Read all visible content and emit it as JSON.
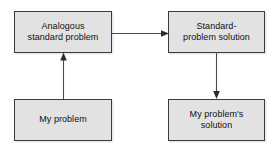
{
  "diagram": {
    "type": "flowchart",
    "background_color": "#ffffff",
    "box_fill_color": "#e2e2e2",
    "box_border_color": "#3a3a3a",
    "arrow_color": "#4a4a4a",
    "text_color": "#111111",
    "nodes": [
      {
        "id": "analogous-standard-problem",
        "label": "Analogous\nstandard problem",
        "position": "top-left"
      },
      {
        "id": "standard-problem-solution",
        "label": "Standard-\nproblem solution",
        "position": "top-right"
      },
      {
        "id": "my-problem",
        "label": "My problem",
        "position": "bottom-left"
      },
      {
        "id": "my-problems-solution",
        "label": "My problem's\nsolution",
        "position": "bottom-right"
      }
    ],
    "arrows": [
      {
        "id": "my-problem-to-analogous",
        "from": "my-problem",
        "to": "analogous-standard-problem",
        "direction": "up"
      },
      {
        "id": "analogous-to-standard-solution",
        "from": "analogous-standard-problem",
        "to": "standard-problem-solution",
        "direction": "right"
      },
      {
        "id": "standard-solution-to-my-solution",
        "from": "standard-problem-solution",
        "to": "my-problems-solution",
        "direction": "down"
      }
    ]
  }
}
